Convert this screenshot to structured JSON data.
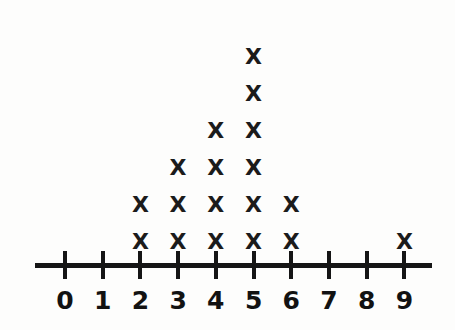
{
  "figure": {
    "kind": "dot-plot",
    "mark_glyph": "X",
    "background_color": "#fdfdfc",
    "ink_color": "#151515"
  },
  "axis": {
    "name": "number-line",
    "tick_labels": [
      "0",
      "1",
      "2",
      "3",
      "4",
      "5",
      "6",
      "7",
      "8",
      "9"
    ],
    "line_color": "#151515"
  },
  "chart_data": {
    "type": "scatter",
    "title": "",
    "subtitle": "",
    "xlabel": "",
    "ylabel": "",
    "categories": [
      "0",
      "1",
      "2",
      "3",
      "4",
      "5",
      "6",
      "7",
      "8",
      "9"
    ],
    "x": [
      0,
      1,
      2,
      3,
      4,
      5,
      6,
      7,
      8,
      9
    ],
    "values": [
      0,
      0,
      2,
      3,
      4,
      6,
      2,
      0,
      0,
      1
    ],
    "counts": [
      {
        "value": "0",
        "count": 0
      },
      {
        "value": "1",
        "count": 0
      },
      {
        "value": "2",
        "count": 2
      },
      {
        "value": "3",
        "count": 3
      },
      {
        "value": "4",
        "count": 4
      },
      {
        "value": "5",
        "count": 6
      },
      {
        "value": "6",
        "count": 2
      },
      {
        "value": "7",
        "count": 0
      },
      {
        "value": "8",
        "count": 0
      },
      {
        "value": "9",
        "count": 1
      }
    ],
    "total_marks": 18,
    "xlim": [
      0,
      9
    ],
    "ylim": [
      0,
      6
    ],
    "grid": false,
    "legend": null,
    "annotations": [],
    "marker": "X"
  }
}
